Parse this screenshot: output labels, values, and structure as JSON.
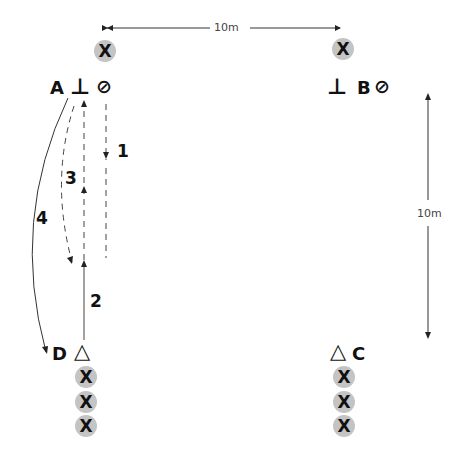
{
  "diagram": {
    "measurements": {
      "horizontal": "10m",
      "vertical": "10m"
    },
    "stations": {
      "A": {
        "label": "A",
        "marker_left": "⊥",
        "marker_right": "⊘"
      },
      "B": {
        "label": "B",
        "marker_left": "⊥",
        "marker_right": "⊘"
      },
      "C": {
        "label": "C",
        "marker": "△"
      },
      "D": {
        "label": "D",
        "marker": "△"
      }
    },
    "players": {
      "symbol": "X",
      "top_left": [
        "X"
      ],
      "top_right": [
        "X"
      ],
      "bottom_left": [
        "X",
        "X",
        "X"
      ],
      "bottom_right": [
        "X",
        "X",
        "X"
      ]
    },
    "movements": [
      {
        "number": "1",
        "type": "dashed",
        "description": "from A-cone down the right side"
      },
      {
        "number": "2",
        "type": "solid",
        "description": "from D up toward center"
      },
      {
        "number": "3",
        "type": "dashed",
        "description": "up toward A"
      },
      {
        "number": "4",
        "type": "dashed-curve",
        "description": "curve from A down to center"
      }
    ],
    "colors": {
      "cone_fill": "#c4c4c4",
      "line": "#333333",
      "text": "#111111"
    }
  }
}
